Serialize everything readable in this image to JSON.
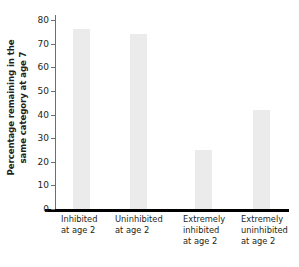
{
  "chart_data": {
    "type": "bar",
    "title": "",
    "subtitle": "",
    "xlabel": "",
    "ylabel": "Percentage remaining in the same category at age 7",
    "ylabel_lines": [
      "Percentage remaining in the",
      "same category at age 7"
    ],
    "categories": [
      "Inhibited at age 2",
      "Uninhibited at age 2",
      "Extremely inhibited at age 2",
      "Extremely uninhibited at age 2"
    ],
    "category_lines": [
      [
        "Inhibited",
        "at age 2"
      ],
      [
        "Uninhibited",
        "at age 2"
      ],
      [
        "Extremely",
        "inhibited",
        "at age 2"
      ],
      [
        "Extremely",
        "uninhibited",
        "at age 2"
      ]
    ],
    "values": [
      76,
      74,
      25,
      42
    ],
    "ylim": [
      0,
      80
    ],
    "ytick_values": [
      0,
      10,
      20,
      30,
      40,
      50,
      60,
      70,
      80
    ],
    "ytick_labels": [
      "0",
      "10",
      "20",
      "30",
      "40",
      "50",
      "60",
      "70",
      "80"
    ],
    "grid": false,
    "legend": null,
    "bar_color": "#ebebeb",
    "axis_color": "#6d6e71",
    "baseline_color": "#000000",
    "text_color": "#231f20",
    "background": "#ffffff"
  }
}
